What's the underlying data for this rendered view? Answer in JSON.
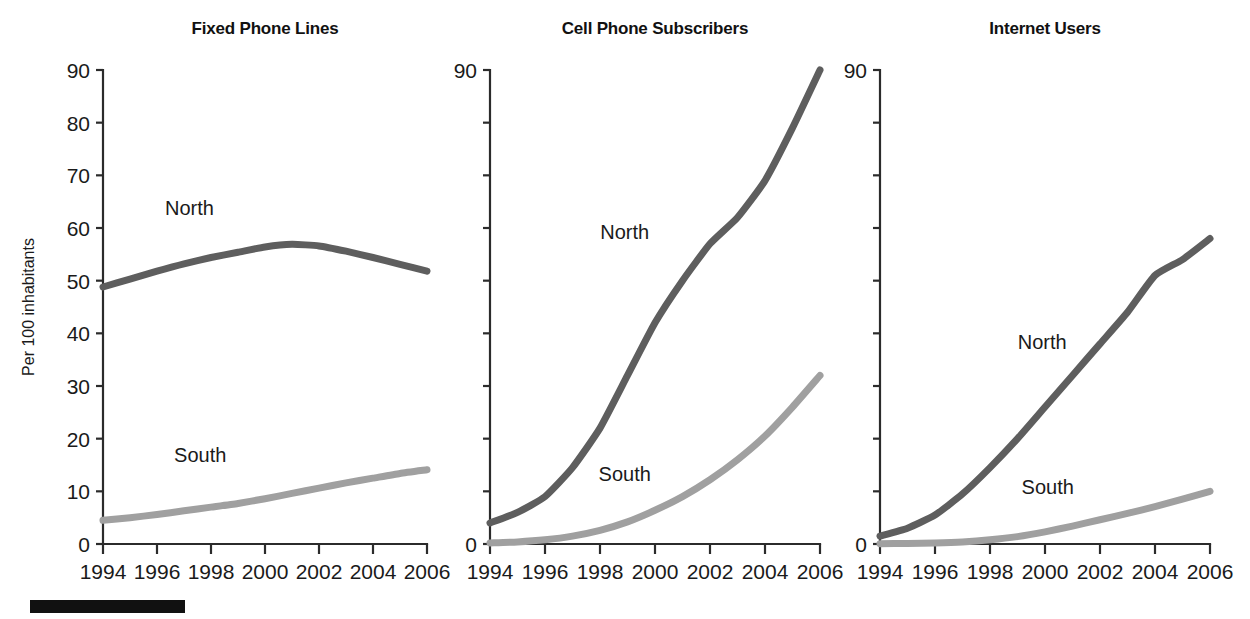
{
  "figure": {
    "y_axis_title": "Per 100 inhabitants",
    "series_names": [
      "North",
      "South"
    ],
    "colors": {
      "north": "#5e5e5e",
      "south": "#a0a0a0",
      "axis": "#2b2b2b",
      "text": "#1a1a1a",
      "footer_rule": "#111111",
      "background": "#ffffff"
    },
    "footer_rule_visible": true
  },
  "chart_data": [
    {
      "type": "line",
      "title": "Fixed Phone Lines",
      "xlabel": "",
      "ylabel": "Per 100 inhabitants",
      "x": [
        1994,
        1995,
        1996,
        1997,
        1998,
        1999,
        2000,
        2001,
        2002,
        2003,
        2004,
        2005,
        2006
      ],
      "xticks": [
        1994,
        1996,
        1998,
        2000,
        2002,
        2004,
        2006
      ],
      "xticklabels": [
        "1994",
        "1996",
        "1998",
        "2000",
        "2002",
        "2004",
        "2006"
      ],
      "yticks": [
        0,
        10,
        20,
        30,
        40,
        50,
        60,
        70,
        80,
        90
      ],
      "yticklabels": [
        "0",
        "10",
        "20",
        "30",
        "40",
        "50",
        "60",
        "70",
        "80",
        "90"
      ],
      "xlim": [
        1994,
        2006
      ],
      "ylim": [
        0,
        90
      ],
      "grid": false,
      "legend_position": "inline-labels",
      "series": [
        {
          "name": "North",
          "color": "#5e5e5e",
          "label_x": 1997.2,
          "label_y": 62.5,
          "values": [
            48.8,
            50.3,
            51.8,
            53.2,
            54.4,
            55.4,
            56.4,
            56.9,
            56.6,
            55.6,
            54.4,
            53.1,
            51.8
          ]
        },
        {
          "name": "South",
          "color": "#a0a0a0",
          "label_x": 1997.6,
          "label_y": 15.5,
          "values": [
            4.5,
            5.0,
            5.6,
            6.3,
            7.0,
            7.7,
            8.6,
            9.6,
            10.6,
            11.6,
            12.5,
            13.4,
            14.1
          ]
        }
      ]
    },
    {
      "type": "line",
      "title": "Cell Phone Subscribers",
      "xlabel": "",
      "ylabel": "",
      "x": [
        1994,
        1995,
        1996,
        1997,
        1998,
        1999,
        2000,
        2001,
        2002,
        2003,
        2004,
        2005,
        2006
      ],
      "xticks": [
        1994,
        1996,
        1998,
        2000,
        2002,
        2004,
        2006
      ],
      "xticklabels": [
        "1994",
        "1996",
        "1998",
        "2000",
        "2002",
        "2004",
        "2006"
      ],
      "yticks": [
        0,
        10,
        20,
        30,
        40,
        50,
        60,
        70,
        80,
        90
      ],
      "yticklabels": [
        "0",
        "90"
      ],
      "labeled_yticks": [
        0,
        90
      ],
      "xlim": [
        1994,
        2006
      ],
      "ylim": [
        0,
        90
      ],
      "grid": false,
      "legend_position": "inline-labels",
      "series": [
        {
          "name": "North",
          "color": "#5e5e5e",
          "label_x": 1998.9,
          "label_y": 58.0,
          "values": [
            4.0,
            6.0,
            9.0,
            14.5,
            22.0,
            32.0,
            42.0,
            50.0,
            57.0,
            62.0,
            69.0,
            79.0,
            90.0
          ]
        },
        {
          "name": "South",
          "color": "#a0a0a0",
          "label_x": 1998.9,
          "label_y": 12.0,
          "values": [
            0.2,
            0.4,
            0.8,
            1.5,
            2.6,
            4.2,
            6.4,
            9.0,
            12.2,
            16.0,
            20.5,
            26.0,
            32.0
          ]
        }
      ]
    },
    {
      "type": "line",
      "title": "Internet Users",
      "xlabel": "",
      "ylabel": "",
      "x": [
        1994,
        1995,
        1996,
        1997,
        1998,
        1999,
        2000,
        2001,
        2002,
        2003,
        2004,
        2005,
        2006
      ],
      "xticks": [
        1994,
        1996,
        1998,
        2000,
        2002,
        2004,
        2006
      ],
      "xticklabels": [
        "1994",
        "1996",
        "1998",
        "2000",
        "2002",
        "2004",
        "2006"
      ],
      "yticks": [
        0,
        10,
        20,
        30,
        40,
        50,
        60,
        70,
        80,
        90
      ],
      "yticklabels": [
        "0",
        "90"
      ],
      "labeled_yticks": [
        0,
        90
      ],
      "xlim": [
        1994,
        2006
      ],
      "ylim": [
        0,
        90
      ],
      "grid": false,
      "legend_position": "inline-labels",
      "series": [
        {
          "name": "North",
          "color": "#5e5e5e",
          "label_x": 1999.9,
          "label_y": 37.0,
          "values": [
            1.5,
            3.0,
            5.5,
            9.5,
            14.5,
            20.0,
            26.0,
            32.0,
            38.0,
            44.0,
            51.0,
            54.0,
            58.0
          ]
        },
        {
          "name": "South",
          "color": "#a0a0a0",
          "label_x": 2000.1,
          "label_y": 9.5,
          "values": [
            0.05,
            0.1,
            0.2,
            0.4,
            0.8,
            1.4,
            2.3,
            3.4,
            4.6,
            5.8,
            7.1,
            8.5,
            10.0
          ]
        }
      ]
    }
  ]
}
